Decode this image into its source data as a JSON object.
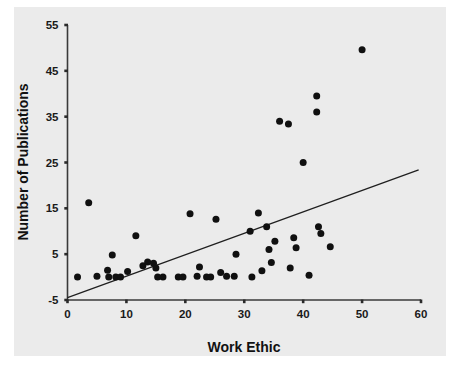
{
  "chart_data": {
    "type": "scatter",
    "title": "",
    "xlabel": "Work Ethic",
    "ylabel": "Number of Publications",
    "xlim": [
      0,
      60
    ],
    "ylim": [
      -5,
      55
    ],
    "xticks": [
      0,
      10,
      20,
      30,
      40,
      50,
      60
    ],
    "yticks": [
      -5,
      5,
      15,
      25,
      35,
      45,
      55
    ],
    "xtick_labels": [
      "0",
      "10",
      "20",
      "30",
      "40",
      "50",
      "60"
    ],
    "ytick_labels": [
      "-5",
      "5",
      "15",
      "25",
      "35",
      "45",
      "55"
    ],
    "grid": false,
    "legend": false,
    "marker": "filled-circle",
    "marker_color": "#101010",
    "background_color": "#ebebeb",
    "figure_color": "#ffffff",
    "points": [
      [
        1.7,
        0.0
      ],
      [
        3.6,
        16.2
      ],
      [
        5.0,
        0.2
      ],
      [
        6.8,
        1.5
      ],
      [
        7.0,
        0.0
      ],
      [
        7.6,
        4.8
      ],
      [
        8.2,
        0.0
      ],
      [
        9.0,
        0.0
      ],
      [
        10.2,
        1.2
      ],
      [
        11.6,
        9.0
      ],
      [
        12.8,
        2.5
      ],
      [
        13.6,
        3.3
      ],
      [
        14.6,
        3.0
      ],
      [
        15.0,
        2.0
      ],
      [
        15.3,
        0.0
      ],
      [
        16.2,
        0.0
      ],
      [
        18.8,
        0.0
      ],
      [
        19.6,
        0.0
      ],
      [
        20.8,
        13.8
      ],
      [
        22.0,
        0.2
      ],
      [
        22.4,
        2.2
      ],
      [
        23.6,
        0.0
      ],
      [
        24.3,
        0.0
      ],
      [
        25.2,
        12.6
      ],
      [
        26.0,
        1.0
      ],
      [
        27.0,
        0.2
      ],
      [
        28.3,
        0.2
      ],
      [
        28.6,
        5.0
      ],
      [
        31.0,
        10.0
      ],
      [
        31.3,
        0.0
      ],
      [
        32.4,
        14.0
      ],
      [
        33.0,
        1.4
      ],
      [
        33.8,
        11.0
      ],
      [
        34.2,
        6.0
      ],
      [
        34.6,
        3.2
      ],
      [
        35.2,
        7.8
      ],
      [
        36.0,
        34.0
      ],
      [
        37.5,
        33.4
      ],
      [
        37.8,
        2.0
      ],
      [
        38.4,
        8.6
      ],
      [
        38.8,
        6.4
      ],
      [
        40.0,
        25.0
      ],
      [
        41.0,
        0.4
      ],
      [
        42.3,
        36.0
      ],
      [
        42.3,
        39.5
      ],
      [
        42.6,
        11.0
      ],
      [
        43.0,
        9.5
      ],
      [
        44.6,
        6.6
      ],
      [
        50.0,
        49.6
      ]
    ],
    "fit_line": {
      "x_start": 0.0,
      "y_start": -4.5,
      "x_end": 59.6,
      "y_end": 23.4,
      "color": "#1f1f1f"
    }
  }
}
